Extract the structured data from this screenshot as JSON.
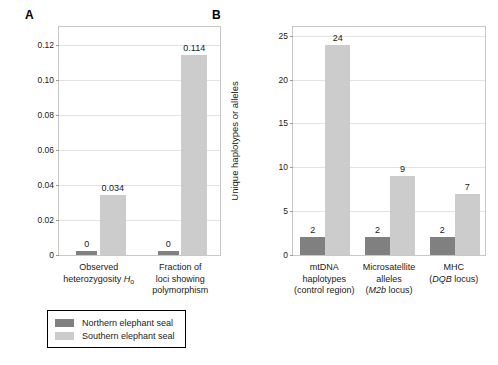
{
  "figure": {
    "background": "#ffffff",
    "panels": [
      {
        "letter": "A"
      },
      {
        "letter": "B"
      }
    ]
  },
  "colors": {
    "northern": "#808080",
    "southern": "#cccccc",
    "frame": "#c8c8c8",
    "grid": "#e2e2e2",
    "text": "#1a1a1a"
  },
  "legend": {
    "items": [
      {
        "label": "Northern elephant seal",
        "color": "#808080",
        "key": "northern"
      },
      {
        "label": "Southern elephant seal",
        "color": "#cccccc",
        "key": "southern"
      }
    ]
  },
  "chart_data": [
    {
      "id": "panel-a",
      "panel": "A",
      "type": "bar",
      "title": "",
      "xlabel": "",
      "ylabel": "",
      "ylim": [
        0,
        0.13
      ],
      "yticks": [
        0,
        0.02,
        0.04,
        0.06,
        0.08,
        0.1,
        0.12
      ],
      "ytick_labels": [
        "0",
        "0.02",
        "0.04",
        "0.06",
        "0.08",
        "0.10",
        "0.12"
      ],
      "grid": true,
      "legend_position": "below-figure",
      "categories": [
        {
          "lines": [
            "Observed",
            "heterozygosity Ho"
          ],
          "html": [
            "Observed",
            "heterozygosity <span class=\"it\">H</span><sub>o</sub>"
          ]
        },
        {
          "lines": [
            "Fraction of",
            "loci showing",
            "polymorphism"
          ],
          "html": [
            "Fraction of",
            "loci showing",
            "polymorphism"
          ]
        }
      ],
      "series": [
        {
          "name": "Northern elephant seal",
          "key": "northern",
          "color": "#808080",
          "values": [
            0,
            0
          ],
          "labels": [
            "0",
            "0"
          ]
        },
        {
          "name": "Southern elephant seal",
          "key": "southern",
          "color": "#cccccc",
          "values": [
            0.034,
            0.114
          ],
          "labels": [
            "0.034",
            "0.114"
          ]
        }
      ]
    },
    {
      "id": "panel-b",
      "panel": "B",
      "type": "bar",
      "title": "",
      "xlabel": "",
      "ylabel": "Unique haplotypes or alleles",
      "ylim": [
        0,
        26
      ],
      "yticks": [
        0,
        5,
        10,
        15,
        20,
        25
      ],
      "ytick_labels": [
        "0",
        "5",
        "10",
        "15",
        "20",
        "25"
      ],
      "grid": true,
      "legend_position": "below-figure",
      "categories": [
        {
          "lines": [
            "mtDNA",
            "haplotypes",
            "(control region)"
          ],
          "html": [
            "mtDNA",
            "haplotypes",
            "(control region)"
          ]
        },
        {
          "lines": [
            "Microsatellite",
            "alleles",
            "(M2b locus)"
          ],
          "html": [
            "Microsatellite",
            "alleles",
            "(<span class=\"it\">M2b</span> locus)"
          ]
        },
        {
          "lines": [
            "MHC",
            "(DQB locus)"
          ],
          "html": [
            "MHC",
            "(<span class=\"it\">DQB</span> locus)"
          ]
        }
      ],
      "series": [
        {
          "name": "Northern elephant seal",
          "key": "northern",
          "color": "#808080",
          "values": [
            2,
            2,
            2
          ],
          "labels": [
            "2",
            "2",
            "2"
          ]
        },
        {
          "name": "Southern elephant seal",
          "key": "southern",
          "color": "#cccccc",
          "values": [
            24,
            9,
            7
          ],
          "labels": [
            "24",
            "9",
            "7"
          ]
        }
      ]
    }
  ]
}
